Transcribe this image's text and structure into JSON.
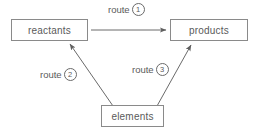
{
  "diagram": {
    "type": "flow-diagram",
    "background_color": "#ffffff",
    "line_color": "#6a6a6a",
    "box_border_color": "#8a8a8a",
    "text_color": "#5a5a5a",
    "nodes": [
      {
        "id": "reactants",
        "label": "reactants"
      },
      {
        "id": "products",
        "label": "products"
      },
      {
        "id": "elements",
        "label": "elements"
      }
    ],
    "edges": [
      {
        "id": "route-1",
        "from": "reactants",
        "to": "products",
        "label_text": "route",
        "label_number": "1",
        "label_number_style": "circled"
      },
      {
        "id": "route-2",
        "from": "elements",
        "to": "reactants",
        "label_text": "route",
        "label_number": "2",
        "label_number_style": "circled"
      },
      {
        "id": "route-3",
        "from": "elements",
        "to": "products",
        "label_text": "route",
        "label_number": "3",
        "label_number_style": "circled"
      }
    ]
  }
}
